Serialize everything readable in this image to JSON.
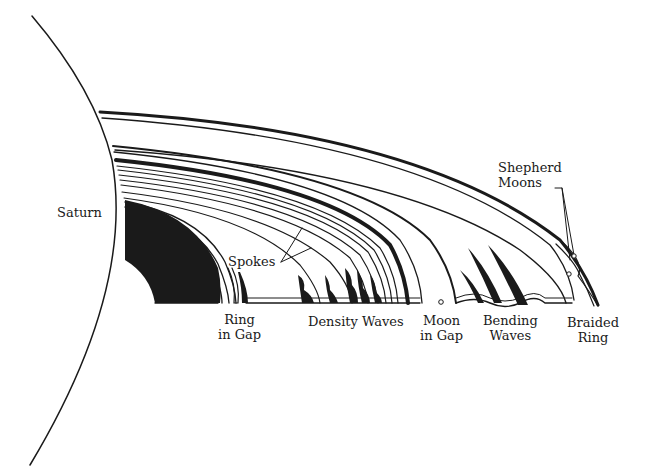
{
  "diagram": {
    "colors": {
      "ink": "#1a1a1a",
      "background": "#ffffff"
    },
    "labels": {
      "saturn": "Saturn",
      "spokes": "Spokes",
      "ring_in_gap": [
        "Ring",
        "in Gap"
      ],
      "density_waves": "Density Waves",
      "moon_in_gap": [
        "Moon",
        "in Gap"
      ],
      "bending_waves": [
        "Bending",
        "Waves"
      ],
      "braided_ring": [
        "Braided",
        "Ring"
      ],
      "shepherd_moons": [
        "Shepherd",
        "Moons"
      ]
    }
  }
}
